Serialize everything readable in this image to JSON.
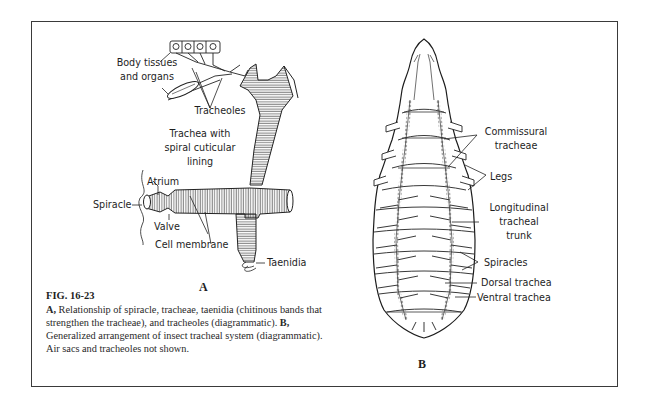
{
  "figure": {
    "number": "FIG. 16-23",
    "caption": {
      "a_label": "A,",
      "a_text": " Relationship of spiracle, tracheae, taenidia (chitinous bands that strengthen the tracheae), and tracheoles (diagrammatic). ",
      "b_label": "B,",
      "b_text": " Generalized arrangement of insect tracheal system (diagrammatic). Air sacs and tracheoles not shown."
    }
  },
  "panel_a": {
    "letter": "A",
    "labels": {
      "body_tissues_1": "Body tissues",
      "body_tissues_2": "and organs",
      "tracheoles": "Tracheoles",
      "trachea_1": "Trachea with",
      "trachea_2": "spiral cuticular",
      "trachea_3": "lining",
      "atrium": "Atrium",
      "spiracle": "Spiracle",
      "valve": "Valve",
      "cell_membrane": "Cell membrane",
      "taenidia": "Taenidia"
    }
  },
  "panel_b": {
    "letter": "B",
    "labels": {
      "commissural_1": "Commissural",
      "commissural_2": "tracheae",
      "legs": "Legs",
      "longitudinal_1": "Longitudinal",
      "longitudinal_2": "tracheal",
      "longitudinal_3": "trunk",
      "spiracles": "Spiracles",
      "dorsal": "Dorsal trachea",
      "ventral": "Ventral trachea"
    }
  }
}
